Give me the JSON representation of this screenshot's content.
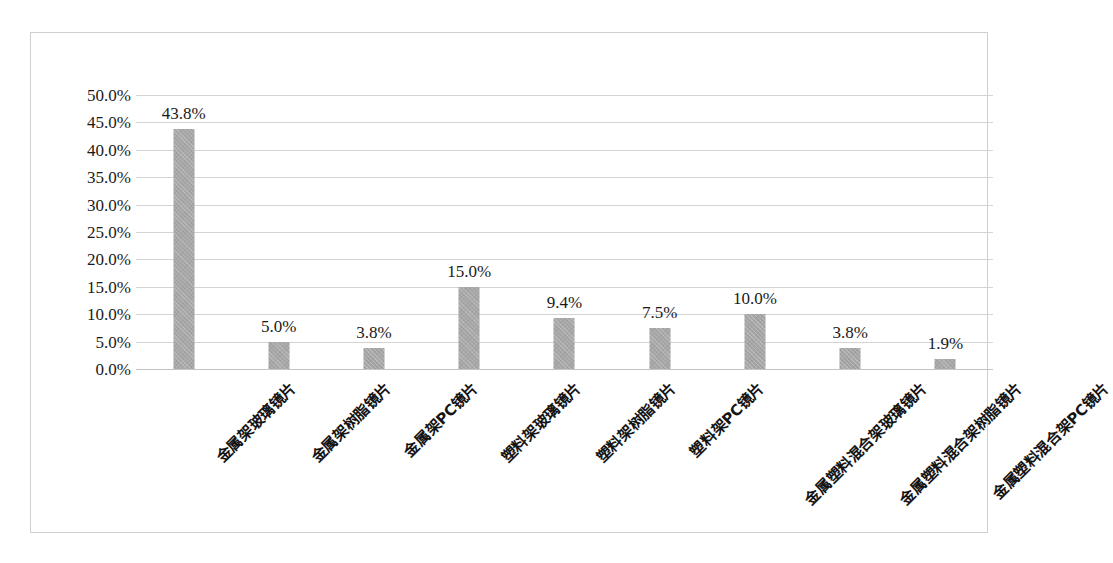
{
  "chart_data": {
    "type": "bar",
    "title": "",
    "xlabel": "",
    "ylabel": "",
    "ylim": [
      0,
      50
    ],
    "ytick_step": 5,
    "grid": true,
    "legend": "none",
    "value_suffix": "%",
    "bar_color": "#a6a6a6",
    "gridline_color": "#d4d4d4",
    "border_color": "#cfcfcf",
    "categories": [
      "金属架玻璃镜片",
      "金属架树脂镜片",
      "金属架PC镜片",
      "塑料架玻璃镜片",
      "塑料架树脂镜片",
      "塑料架PC镜片",
      "金属塑料混合架玻璃镜片",
      "金属塑料混合架树脂镜片",
      "金属塑料混合架PC镜片"
    ],
    "values": [
      43.8,
      5.0,
      3.8,
      15.0,
      9.4,
      7.5,
      10.0,
      3.8,
      1.9
    ],
    "data_labels": [
      "43.8%",
      "5.0%",
      "3.8%",
      "15.0%",
      "9.4%",
      "7.5%",
      "10.0%",
      "3.8%",
      "1.9%"
    ],
    "ytick_labels": [
      "50.0%",
      "45.0%",
      "40.0%",
      "35.0%",
      "30.0%",
      "25.0%",
      "20.0%",
      "15.0%",
      "10.0%",
      "5.0%",
      "0.0%"
    ],
    "ytick_values": [
      50,
      45,
      40,
      35,
      30,
      25,
      20,
      15,
      10,
      5,
      0
    ]
  }
}
